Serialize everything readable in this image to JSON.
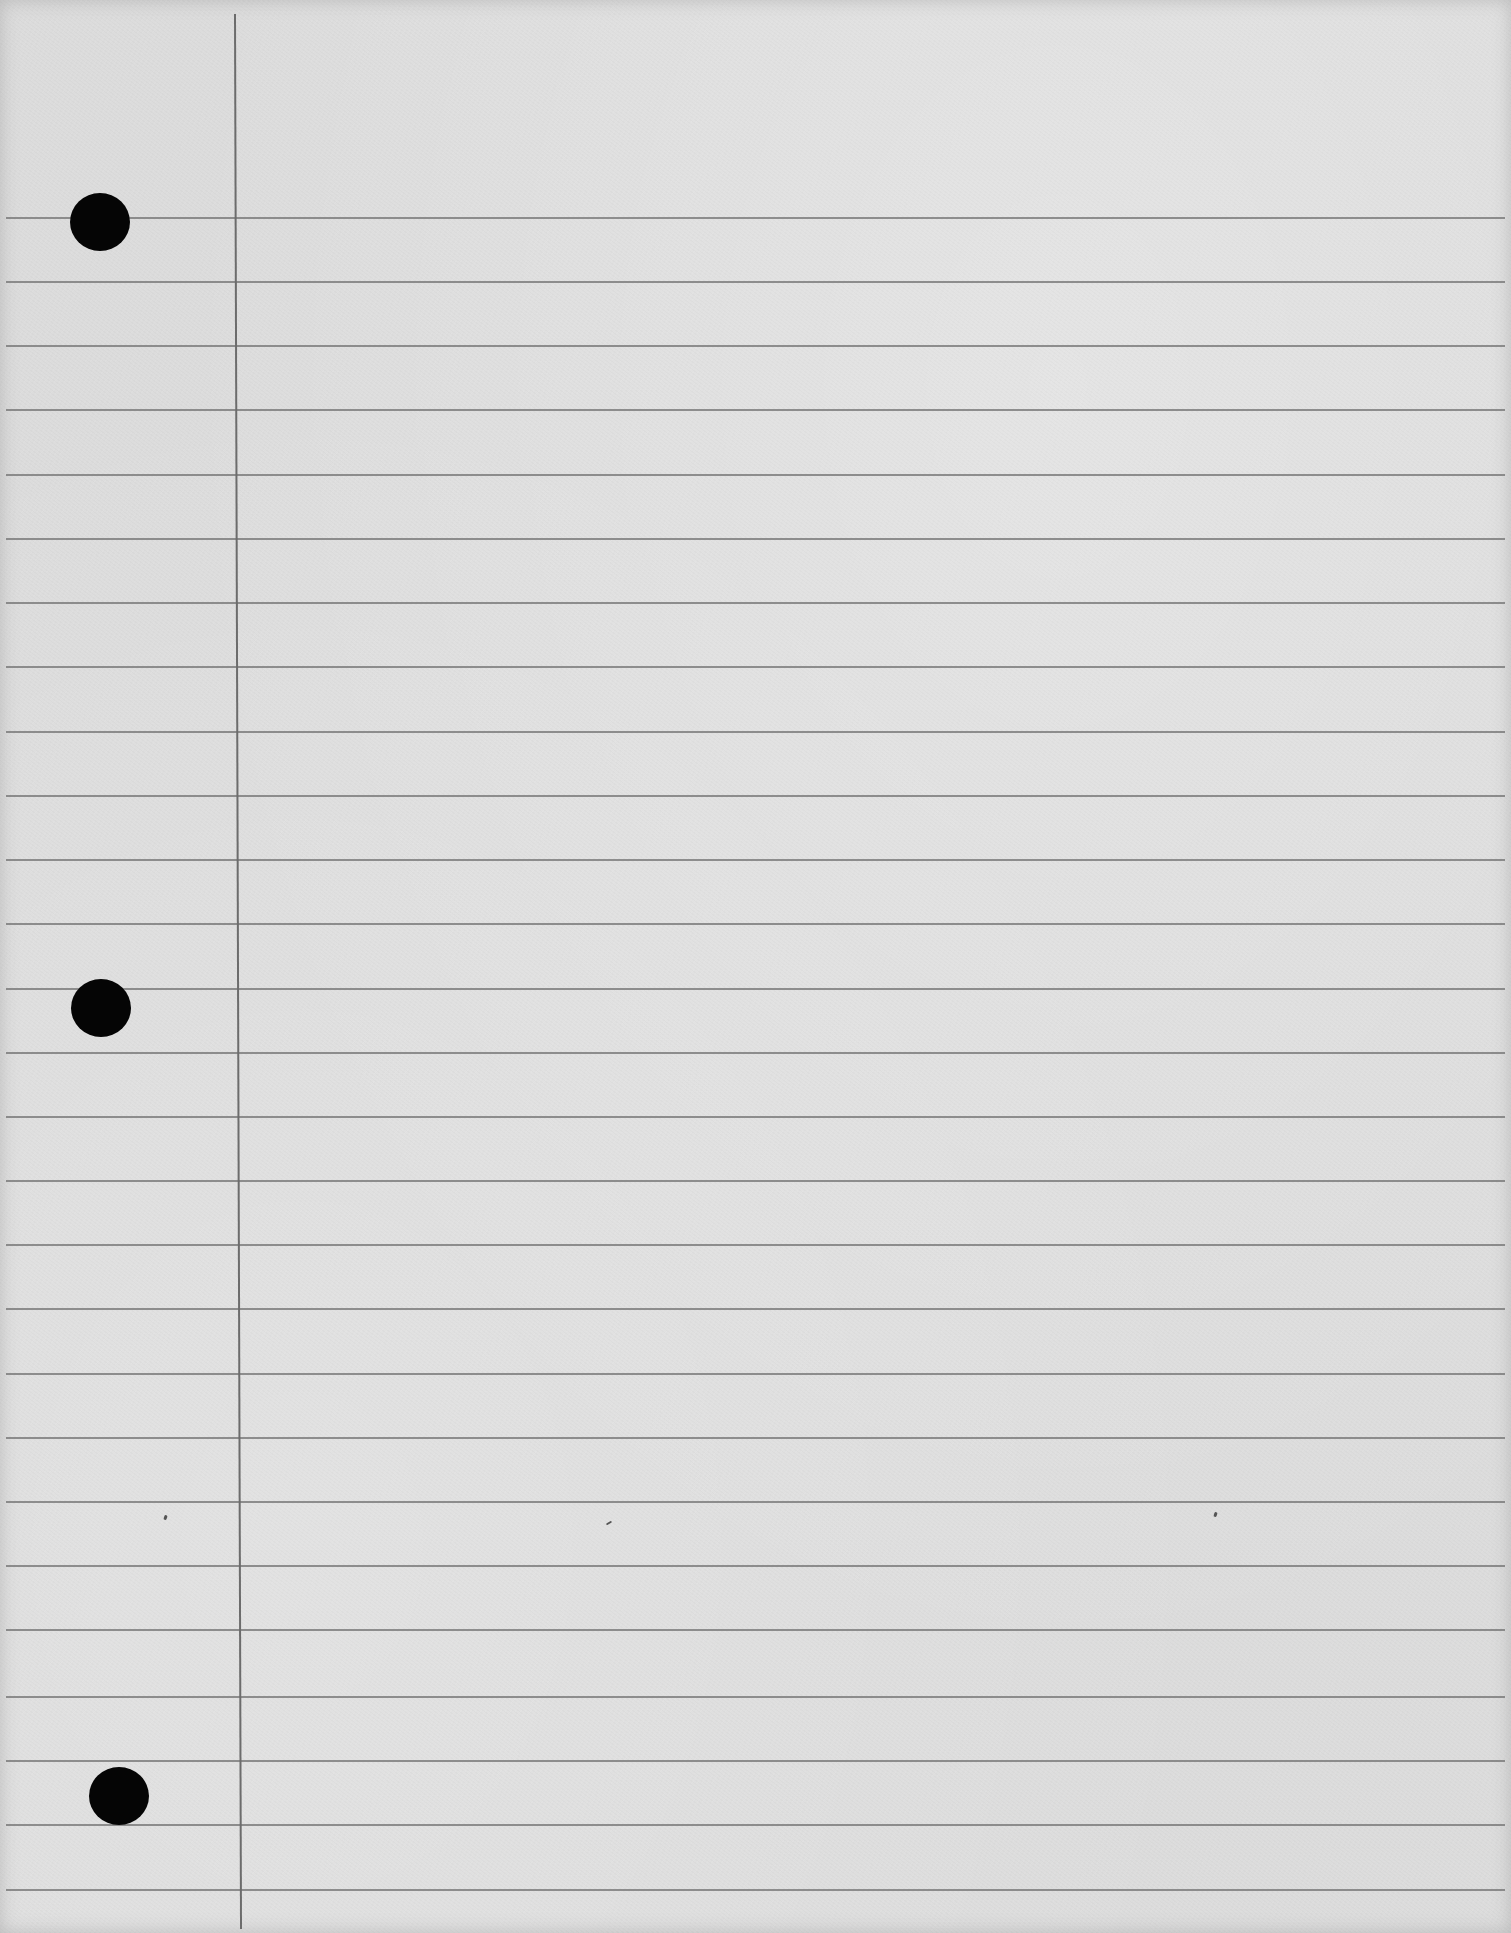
{
  "page": {
    "type": "ruled-notebook-paper",
    "paper_color": "#dcdcdc",
    "rule_color": "#7e7e7e",
    "margin_color": "#6c6c6c",
    "hole_color": "#050505",
    "text": ""
  },
  "rules_y": [
    217,
    281,
    345,
    409,
    474,
    538,
    602,
    666,
    731,
    795,
    859,
    923,
    988,
    1052,
    1116,
    1180,
    1244,
    1308,
    1373,
    1437,
    1501,
    1565,
    1629,
    1696,
    1760,
    1824,
    1889
  ],
  "margin_x": 234,
  "holes": [
    {
      "name": "top-hole",
      "cx": 100,
      "cy": 223,
      "r": 30
    },
    {
      "name": "middle-hole",
      "cx": 101,
      "cy": 1009,
      "r": 30
    },
    {
      "name": "bottom-hole",
      "cx": 119,
      "cy": 1797,
      "r": 30
    }
  ]
}
